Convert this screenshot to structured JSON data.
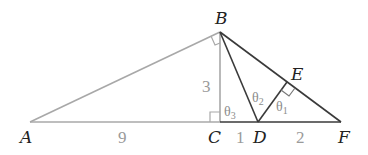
{
  "diagram": {
    "type": "geometry",
    "colors": {
      "grey_line": "#a8a8a8",
      "dark_line": "#3a3a3a",
      "label": "#222222",
      "length_label": "#9a9a9a",
      "angle_label": "#8c8c8c"
    },
    "points": {
      "A": {
        "label": "A"
      },
      "B": {
        "label": "B"
      },
      "C": {
        "label": "C"
      },
      "D": {
        "label": "D"
      },
      "E": {
        "label": "E"
      },
      "F": {
        "label": "F"
      }
    },
    "lengths": {
      "AC": "9",
      "BC": "3",
      "CD": "1",
      "DF": "2"
    },
    "angles": {
      "theta1": {
        "symbol": "θ",
        "sub": "1"
      },
      "theta2": {
        "symbol": "θ",
        "sub": "2"
      },
      "theta3": {
        "symbol": "θ",
        "sub": "3"
      }
    },
    "right_angles": [
      "ABC",
      "BCA",
      "DEF"
    ],
    "segments": [
      {
        "from": "A",
        "to": "B",
        "style": "grey"
      },
      {
        "from": "A",
        "to": "C",
        "style": "grey"
      },
      {
        "from": "B",
        "to": "C",
        "style": "grey"
      },
      {
        "from": "B",
        "to": "D",
        "style": "dark"
      },
      {
        "from": "B",
        "to": "F",
        "style": "dark"
      },
      {
        "from": "D",
        "to": "E",
        "style": "dark"
      },
      {
        "from": "C",
        "to": "F",
        "style": "dark"
      }
    ]
  }
}
